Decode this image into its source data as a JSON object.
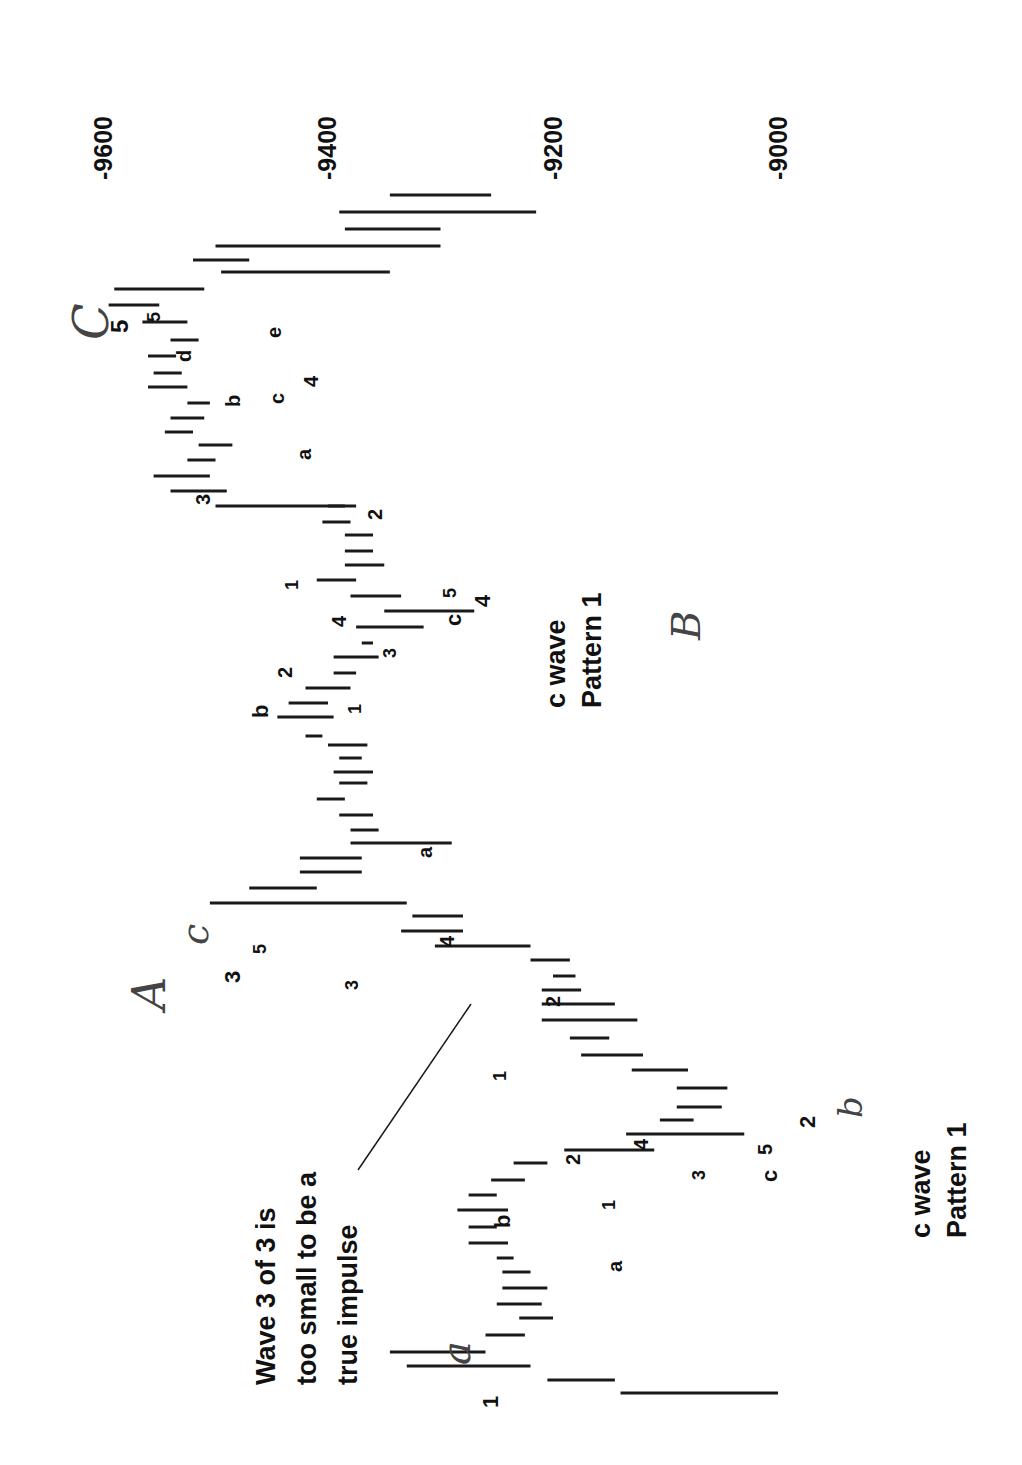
{
  "chart_data": {
    "type": "bar",
    "subtype": "range-bar (high-low price bars), page rotated 90 degrees",
    "title": "",
    "xlabel": "",
    "ylabel": "Price",
    "orientation": "rotated 90deg clockwise; price axis runs horizontally at top, time runs bottom-to-top",
    "axis": {
      "ticks": [
        "-9600",
        "-9400",
        "-9200",
        "-9000"
      ],
      "tick_values": [
        9600,
        9400,
        9200,
        9000
      ],
      "tick_x": [
        103,
        327,
        553,
        778
      ],
      "range": [
        8980,
        9640
      ]
    },
    "grid": false,
    "legend": null,
    "bars_note": "Each bar: y = vertical screen position (time index, higher y = earlier), low/high = price range read from axis.",
    "bars": [
      {
        "y": 1393,
        "low": 9000,
        "high": 9140
      },
      {
        "y": 1380,
        "low": 9145,
        "high": 9205
      },
      {
        "y": 1366,
        "low": 9220,
        "high": 9330
      },
      {
        "y": 1352,
        "low": 9260,
        "high": 9345
      },
      {
        "y": 1335,
        "low": 9225,
        "high": 9260
      },
      {
        "y": 1318,
        "low": 9200,
        "high": 9230
      },
      {
        "y": 1304,
        "low": 9210,
        "high": 9250
      },
      {
        "y": 1288,
        "low": 9205,
        "high": 9245
      },
      {
        "y": 1272,
        "low": 9220,
        "high": 9245
      },
      {
        "y": 1258,
        "low": 9235,
        "high": 9250
      },
      {
        "y": 1243,
        "low": 9240,
        "high": 9275
      },
      {
        "y": 1227,
        "low": 9250,
        "high": 9275
      },
      {
        "y": 1210,
        "low": 9240,
        "high": 9285
      },
      {
        "y": 1195,
        "low": 9250,
        "high": 9275
      },
      {
        "y": 1180,
        "low": 9225,
        "high": 9255
      },
      {
        "y": 1163,
        "low": 9205,
        "high": 9235
      },
      {
        "y": 1150,
        "low": 9110,
        "high": 9190
      },
      {
        "y": 1134,
        "low": 9030,
        "high": 9135
      },
      {
        "y": 1120,
        "low": 9075,
        "high": 9105
      },
      {
        "y": 1107,
        "low": 9050,
        "high": 9090
      },
      {
        "y": 1088,
        "low": 9045,
        "high": 9090
      },
      {
        "y": 1070,
        "low": 9080,
        "high": 9130
      },
      {
        "y": 1055,
        "low": 9120,
        "high": 9175
      },
      {
        "y": 1038,
        "low": 9150,
        "high": 9185
      },
      {
        "y": 1020,
        "low": 9125,
        "high": 9210
      },
      {
        "y": 1004,
        "low": 9145,
        "high": 9210
      },
      {
        "y": 990,
        "low": 9175,
        "high": 9210
      },
      {
        "y": 976,
        "low": 9180,
        "high": 9200
      },
      {
        "y": 960,
        "low": 9185,
        "high": 9220
      },
      {
        "y": 946,
        "low": 9220,
        "high": 9305
      },
      {
        "y": 931,
        "low": 9280,
        "high": 9335
      },
      {
        "y": 916,
        "low": 9280,
        "high": 9325
      },
      {
        "y": 903,
        "low": 9330,
        "high": 9505
      },
      {
        "y": 888,
        "low": 9410,
        "high": 9470
      },
      {
        "y": 872,
        "low": 9370,
        "high": 9425
      },
      {
        "y": 858,
        "low": 9370,
        "high": 9425
      },
      {
        "y": 843,
        "low": 9290,
        "high": 9380
      },
      {
        "y": 830,
        "low": 9355,
        "high": 9380
      },
      {
        "y": 815,
        "low": 9360,
        "high": 9390
      },
      {
        "y": 799,
        "low": 9385,
        "high": 9410
      },
      {
        "y": 783,
        "low": 9365,
        "high": 9390
      },
      {
        "y": 772,
        "low": 9360,
        "high": 9395
      },
      {
        "y": 758,
        "low": 9370,
        "high": 9390
      },
      {
        "y": 745,
        "low": 9365,
        "high": 9400
      },
      {
        "y": 736,
        "low": 9405,
        "high": 9420
      },
      {
        "y": 717,
        "low": 9395,
        "high": 9445
      },
      {
        "y": 703,
        "low": 9400,
        "high": 9435
      },
      {
        "y": 688,
        "low": 9380,
        "high": 9420
      },
      {
        "y": 673,
        "low": 9375,
        "high": 9395
      },
      {
        "y": 657,
        "low": 9355,
        "high": 9395
      },
      {
        "y": 643,
        "low": 9360,
        "high": 9370
      },
      {
        "y": 627,
        "low": 9315,
        "high": 9375
      },
      {
        "y": 611,
        "low": 9270,
        "high": 9350
      },
      {
        "y": 596,
        "low": 9335,
        "high": 9380
      },
      {
        "y": 580,
        "low": 9375,
        "high": 9410
      },
      {
        "y": 565,
        "low": 9350,
        "high": 9385
      },
      {
        "y": 551,
        "low": 9360,
        "high": 9385
      },
      {
        "y": 535,
        "low": 9360,
        "high": 9385
      },
      {
        "y": 522,
        "low": 9380,
        "high": 9405
      },
      {
        "y": 506,
        "low": 9385,
        "high": 9400
      },
      {
        "y": 506,
        "low": 9500,
        "high": 9375
      },
      {
        "y": 491,
        "low": 9490,
        "high": 9540
      },
      {
        "y": 476,
        "low": 9505,
        "high": 9555
      },
      {
        "y": 460,
        "low": 9500,
        "high": 9525
      },
      {
        "y": 445,
        "low": 9485,
        "high": 9515
      },
      {
        "y": 432,
        "low": 9520,
        "high": 9545
      },
      {
        "y": 418,
        "low": 9510,
        "high": 9540
      },
      {
        "y": 403,
        "low": 9505,
        "high": 9525
      },
      {
        "y": 387,
        "low": 9525,
        "high": 9560
      },
      {
        "y": 373,
        "low": 9530,
        "high": 9555
      },
      {
        "y": 356,
        "low": 9535,
        "high": 9560
      },
      {
        "y": 340,
        "low": 9515,
        "high": 9540
      },
      {
        "y": 322,
        "low": 9525,
        "high": 9565
      },
      {
        "y": 305,
        "low": 9550,
        "high": 9595
      },
      {
        "y": 289,
        "low": 9510,
        "high": 9590
      },
      {
        "y": 272,
        "low": 9345,
        "high": 9495
      },
      {
        "y": 260,
        "low": 9470,
        "high": 9520
      },
      {
        "y": 246,
        "low": 9300,
        "high": 9500
      },
      {
        "y": 229,
        "low": 9300,
        "high": 9385
      },
      {
        "y": 212,
        "low": 9215,
        "high": 9390
      },
      {
        "y": 195,
        "low": 9255,
        "high": 9345
      }
    ],
    "annotations": [
      {
        "text": "Wave 3 of 3 is too small to be a true impulse",
        "type": "callout"
      },
      {
        "text": "c wave Pattern 1",
        "type": "note",
        "count": 2
      },
      {
        "text": "A",
        "type": "handwritten"
      },
      {
        "text": "B",
        "type": "handwritten"
      },
      {
        "text": "C",
        "type": "handwritten"
      },
      {
        "text": "a",
        "type": "handwritten"
      },
      {
        "text": "b",
        "type": "handwritten"
      },
      {
        "text": "c",
        "type": "handwritten"
      }
    ]
  },
  "axis_ticks": [
    {
      "label": "-9600",
      "x": 103
    },
    {
      "label": "-9400",
      "x": 327
    },
    {
      "label": "-9200",
      "x": 553
    },
    {
      "label": "-9000",
      "x": 778
    }
  ],
  "notes": {
    "callout_line1": "Wave 3 of 3 is",
    "callout_line2": "too small to be a",
    "callout_line3": "true impulse",
    "cwave_top_line1": "c wave",
    "cwave_top_line2": "Pattern 1",
    "cwave_bottom_line1": "c wave",
    "cwave_bottom_line2": "Pattern 1"
  },
  "handwritten": {
    "A": "A",
    "B": "B",
    "C": "C",
    "a": "a",
    "b": "b",
    "c_small": "c"
  },
  "wave_labels": [
    {
      "text": "1",
      "x": 498,
      "y": 1408,
      "size": 22
    },
    {
      "text": "b",
      "x": 510,
      "y": 1228,
      "size": 22
    },
    {
      "text": "a",
      "x": 622,
      "y": 1272,
      "size": 20
    },
    {
      "text": "1",
      "x": 615,
      "y": 1210,
      "size": 18
    },
    {
      "text": "2",
      "x": 580,
      "y": 1165,
      "size": 20
    },
    {
      "text": "3",
      "x": 705,
      "y": 1180,
      "size": 18
    },
    {
      "text": "4",
      "x": 648,
      "y": 1150,
      "size": 20
    },
    {
      "text": "c",
      "x": 777,
      "y": 1182,
      "size": 22
    },
    {
      "text": "5",
      "x": 772,
      "y": 1155,
      "size": 20
    },
    {
      "text": "2",
      "x": 815,
      "y": 1128,
      "size": 22
    },
    {
      "text": "1",
      "x": 506,
      "y": 1081,
      "size": 18
    },
    {
      "text": "2",
      "x": 560,
      "y": 1007,
      "size": 20
    },
    {
      "text": "3",
      "x": 358,
      "y": 990,
      "size": 18
    },
    {
      "text": "4",
      "x": 454,
      "y": 947,
      "size": 20
    },
    {
      "text": "3",
      "x": 240,
      "y": 983,
      "size": 22
    },
    {
      "text": "5",
      "x": 266,
      "y": 954,
      "size": 18
    },
    {
      "text": "a",
      "x": 432,
      "y": 858,
      "size": 20
    },
    {
      "text": "b",
      "x": 268,
      "y": 718,
      "size": 22
    },
    {
      "text": "1",
      "x": 361,
      "y": 714,
      "size": 18
    },
    {
      "text": "2",
      "x": 292,
      "y": 678,
      "size": 20
    },
    {
      "text": "3",
      "x": 396,
      "y": 658,
      "size": 18
    },
    {
      "text": "4",
      "x": 346,
      "y": 627,
      "size": 20
    },
    {
      "text": "c",
      "x": 461,
      "y": 626,
      "size": 22
    },
    {
      "text": "5",
      "x": 456,
      "y": 598,
      "size": 18
    },
    {
      "text": "4",
      "x": 490,
      "y": 607,
      "size": 22
    },
    {
      "text": "1",
      "x": 298,
      "y": 590,
      "size": 18
    },
    {
      "text": "2",
      "x": 382,
      "y": 520,
      "size": 20
    },
    {
      "text": "3",
      "x": 210,
      "y": 505,
      "size": 20
    },
    {
      "text": "a",
      "x": 311,
      "y": 460,
      "size": 20
    },
    {
      "text": "b",
      "x": 240,
      "y": 407,
      "size": 20
    },
    {
      "text": "c",
      "x": 284,
      "y": 404,
      "size": 20
    },
    {
      "text": "4",
      "x": 318,
      "y": 387,
      "size": 20
    },
    {
      "text": "d",
      "x": 191,
      "y": 362,
      "size": 20
    },
    {
      "text": "e",
      "x": 281,
      "y": 338,
      "size": 20
    },
    {
      "text": "5",
      "x": 160,
      "y": 322,
      "size": 18
    },
    {
      "text": "5",
      "x": 128,
      "y": 333,
      "size": 24
    }
  ]
}
